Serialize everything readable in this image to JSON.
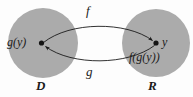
{
  "figure": {
    "type": "function-composition-diagram",
    "background_color": "#fdfdfd",
    "set_fill_color": "#ababab",
    "stroke_color": "#1b1b1b"
  },
  "sets": {
    "domain": {
      "label": "D",
      "point_label": "g(y)",
      "cx": 43,
      "cy": 43,
      "r": 35
    },
    "range": {
      "label": "R",
      "point_label": "y",
      "secondary_label": "f(g(y))",
      "cx": 156,
      "cy": 43,
      "r": 34
    }
  },
  "arrows": {
    "forward": {
      "label": "f",
      "direction": "domain-to-range"
    },
    "backward": {
      "label": "g",
      "direction": "range-to-domain"
    }
  }
}
